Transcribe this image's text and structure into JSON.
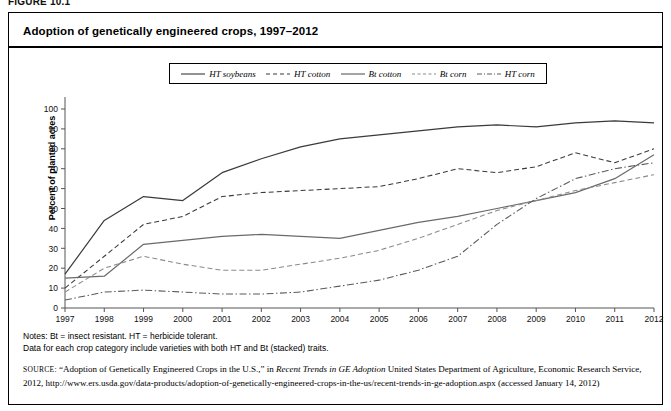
{
  "figure": {
    "label": "FIGURE 10.1",
    "title": "Adoption of genetically engineered crops, 1997–2012"
  },
  "legend": {
    "position": "top-center",
    "items": [
      {
        "label": "HT soybeans",
        "style": "solid",
        "color": "#3a3a3a"
      },
      {
        "label": "HT cotton",
        "style": "dashed",
        "color": "#3a3a3a"
      },
      {
        "label": "Bt cotton",
        "style": "solid",
        "color": "#6a6a6a"
      },
      {
        "label": "Bt corn",
        "style": "dashed",
        "color": "#8a8a8a"
      },
      {
        "label": "HT corn",
        "style": "dashdot",
        "color": "#5a5a5a"
      }
    ]
  },
  "axes": {
    "ylabel": "Percent of planted acres",
    "xlabel": "",
    "yticks": [
      0,
      10,
      20,
      30,
      40,
      50,
      60,
      70,
      80,
      90,
      100
    ],
    "xticks": [
      "1997",
      "1998",
      "1999",
      "2000",
      "2001",
      "2002",
      "2003",
      "2004",
      "2005",
      "2006",
      "2007",
      "2008",
      "2009",
      "2010",
      "2011",
      "2012"
    ]
  },
  "notes": {
    "line1": "Notes: Bt = insect resistant. HT = herbicide tolerant.",
    "line2": "Data for each crop category include varieties with both HT and Bt (stacked) traits."
  },
  "source": {
    "prefix": "SOURCE:",
    "text_a": " “Adoption of Genetically Engineered Crops in the U.S.,” in ",
    "italic_a": "Recent Trends in GE Adoption",
    "text_b": " United States Department of Agriculture, Economic Research Service, 2012, http://www.ers.usda.gov/data-products/adoption-of-genetically-engineered-crops-in-the-us/recent-trends-in-ge-adoption.aspx (accessed January 14, 2012)"
  },
  "chart_data": {
    "type": "line",
    "title": "Adoption of genetically engineered crops, 1997–2012",
    "xlabel": "",
    "ylabel": "Percent of planted acres",
    "xlim": [
      1997,
      2012
    ],
    "ylim": [
      0,
      100
    ],
    "grid": false,
    "legend_position": "top-center",
    "x": [
      1997,
      1998,
      1999,
      2000,
      2001,
      2002,
      2003,
      2004,
      2005,
      2006,
      2007,
      2008,
      2009,
      2010,
      2011,
      2012
    ],
    "series": [
      {
        "name": "HT soybeans",
        "style": "solid",
        "color": "#3a3a3a",
        "values": [
          17,
          44,
          56,
          54,
          68,
          75,
          81,
          85,
          87,
          89,
          91,
          92,
          91,
          93,
          94,
          93
        ]
      },
      {
        "name": "HT cotton",
        "style": "dashed",
        "color": "#3a3a3a",
        "values": [
          10,
          26,
          42,
          46,
          56,
          58,
          59,
          60,
          61,
          65,
          70,
          68,
          71,
          78,
          73,
          80
        ]
      },
      {
        "name": "Bt cotton",
        "style": "solid",
        "color": "#6a6a6a",
        "values": [
          15,
          16,
          32,
          34,
          36,
          37,
          36,
          35,
          39,
          43,
          46,
          50,
          54,
          58,
          65,
          77
        ]
      },
      {
        "name": "Bt corn",
        "style": "dashed",
        "color": "#8a8a8a",
        "values": [
          8,
          20,
          26,
          22,
          19,
          19,
          22,
          25,
          29,
          35,
          42,
          49,
          54,
          59,
          63,
          67
        ]
      },
      {
        "name": "HT corn",
        "style": "dashdot",
        "color": "#5a5a5a",
        "values": [
          4,
          8,
          9,
          8,
          7,
          7,
          8,
          11,
          14,
          19,
          26,
          42,
          55,
          65,
          70,
          73
        ]
      }
    ]
  }
}
